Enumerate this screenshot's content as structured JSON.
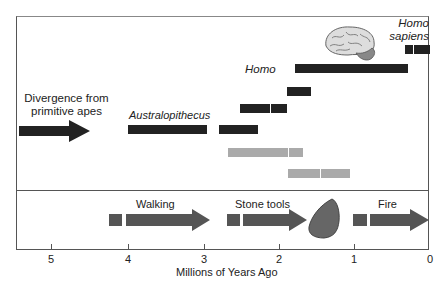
{
  "labels": {
    "divergence": [
      "Divergence from",
      "primitive apes"
    ],
    "australopithecus": "Australopithecus",
    "homo": "Homo",
    "homo_sapiens": [
      "Homo",
      "sapiens"
    ],
    "walking": "Walking",
    "stone_tools": "Stone tools",
    "fire": "Fire"
  },
  "axis": {
    "label": "Millions of Years Ago",
    "ticks": [
      "5",
      "4",
      "3",
      "2",
      "1",
      "0"
    ]
  },
  "colors": {
    "dark_bar": "#222222",
    "gray_bar": "#aaaaaa",
    "arrow": "#555555"
  }
}
